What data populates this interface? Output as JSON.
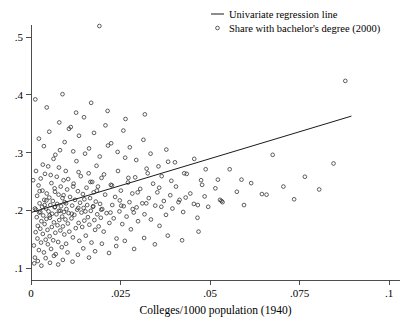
{
  "chart_data": {
    "type": "scatter",
    "title": "",
    "xlabel": "Colleges/1000 population (1940)",
    "ylabel": "",
    "xlim": [
      0,
      0.1
    ],
    "ylim": [
      0.08,
      0.54
    ],
    "grid": false,
    "legend_position": "top-right",
    "xticks": [
      0,
      0.025,
      0.05,
      0.075,
      0.1
    ],
    "xtick_labels": [
      "0",
      ".025",
      ".05",
      ".075",
      ".1"
    ],
    "yticks": [
      0.1,
      0.2,
      0.3,
      0.4,
      0.5
    ],
    "ytick_labels": [
      ".1",
      ".2",
      ".3",
      ".4",
      ".5"
    ],
    "series": [
      {
        "name": "Share with bachelor's degree (2000)",
        "type": "scatter",
        "marker": "open-circle",
        "color": "#2b2b2b",
        "points": [
          [
            0.0008,
            0.139
          ],
          [
            0.0011,
            0.118
          ],
          [
            0.0013,
            0.162
          ],
          [
            0.0014,
            0.201
          ],
          [
            0.0016,
            0.188
          ],
          [
            0.0017,
            0.225
          ],
          [
            0.0018,
            0.151
          ],
          [
            0.0019,
            0.173
          ],
          [
            0.0021,
            0.243
          ],
          [
            0.0022,
            0.131
          ],
          [
            0.0023,
            0.196
          ],
          [
            0.0024,
            0.212
          ],
          [
            0.0026,
            0.168
          ],
          [
            0.0027,
            0.255
          ],
          [
            0.0028,
            0.144
          ],
          [
            0.0029,
            0.181
          ],
          [
            0.0031,
            0.206
          ],
          [
            0.0032,
            0.234
          ],
          [
            0.0033,
            0.159
          ],
          [
            0.0034,
            0.191
          ],
          [
            0.0036,
            0.127
          ],
          [
            0.0037,
            0.218
          ],
          [
            0.0038,
            0.176
          ],
          [
            0.0039,
            0.263
          ],
          [
            0.0041,
            0.149
          ],
          [
            0.0042,
            0.203
          ],
          [
            0.0043,
            0.185
          ],
          [
            0.0044,
            0.229
          ],
          [
            0.0046,
            0.166
          ],
          [
            0.0047,
            0.141
          ],
          [
            0.0048,
            0.276
          ],
          [
            0.0049,
            0.198
          ],
          [
            0.0051,
            0.222
          ],
          [
            0.0052,
            0.155
          ],
          [
            0.0053,
            0.187
          ],
          [
            0.0054,
            0.209
          ],
          [
            0.0056,
            0.133
          ],
          [
            0.0057,
            0.247
          ],
          [
            0.0058,
            0.171
          ],
          [
            0.0059,
            0.194
          ],
          [
            0.0061,
            0.216
          ],
          [
            0.0062,
            0.148
          ],
          [
            0.0063,
            0.289
          ],
          [
            0.0064,
            0.179
          ],
          [
            0.0066,
            0.205
          ],
          [
            0.0067,
            0.232
          ],
          [
            0.0068,
            0.161
          ],
          [
            0.0069,
            0.124
          ],
          [
            0.0071,
            0.193
          ],
          [
            0.0072,
            0.258
          ],
          [
            0.0073,
            0.211
          ],
          [
            0.0074,
            0.174
          ],
          [
            0.0076,
            0.145
          ],
          [
            0.0077,
            0.227
          ],
          [
            0.0078,
            0.199
          ],
          [
            0.0079,
            0.183
          ],
          [
            0.0081,
            0.304
          ],
          [
            0.0082,
            0.165
          ],
          [
            0.0083,
            0.241
          ],
          [
            0.0084,
            0.207
          ],
          [
            0.0086,
            0.136
          ],
          [
            0.0087,
            0.189
          ],
          [
            0.0088,
            0.221
          ],
          [
            0.0089,
            0.172
          ],
          [
            0.0091,
            0.252
          ],
          [
            0.0092,
            0.197
          ],
          [
            0.0093,
            0.158
          ],
          [
            0.0094,
            0.214
          ],
          [
            0.0096,
            0.184
          ],
          [
            0.0097,
            0.268
          ],
          [
            0.0098,
            0.142
          ],
          [
            0.0099,
            0.202
          ],
          [
            0.0101,
            0.236
          ],
          [
            0.0103,
            0.177
          ],
          [
            0.0105,
            0.195
          ],
          [
            0.0107,
            0.163
          ],
          [
            0.0109,
            0.223
          ],
          [
            0.0111,
            0.344
          ],
          [
            0.0113,
            0.186
          ],
          [
            0.0115,
            0.208
          ],
          [
            0.0117,
            0.153
          ],
          [
            0.0119,
            0.246
          ],
          [
            0.0121,
            0.192
          ],
          [
            0.0123,
            0.218
          ],
          [
            0.0125,
            0.169
          ],
          [
            0.0127,
            0.285
          ],
          [
            0.0129,
            0.201
          ],
          [
            0.0131,
            0.233
          ],
          [
            0.0133,
            0.178
          ],
          [
            0.0135,
            0.147
          ],
          [
            0.0137,
            0.213
          ],
          [
            0.0139,
            0.259
          ],
          [
            0.0141,
            0.196
          ],
          [
            0.0143,
            0.171
          ],
          [
            0.0145,
            0.228
          ],
          [
            0.0147,
            0.204
          ],
          [
            0.0149,
            0.182
          ],
          [
            0.0151,
            0.298
          ],
          [
            0.0153,
            0.156
          ],
          [
            0.0155,
            0.239
          ],
          [
            0.0157,
            0.209
          ],
          [
            0.0159,
            0.188
          ],
          [
            0.0161,
            0.264
          ],
          [
            0.0163,
            0.175
          ],
          [
            0.0165,
            0.221
          ],
          [
            0.0167,
            0.199
          ],
          [
            0.0169,
            0.144
          ],
          [
            0.0171,
            0.249
          ],
          [
            0.0173,
            0.206
          ],
          [
            0.0175,
            0.231
          ],
          [
            0.0177,
            0.183
          ],
          [
            0.0179,
            0.166
          ],
          [
            0.0181,
            0.215
          ],
          [
            0.0183,
            0.277
          ],
          [
            0.0185,
            0.193
          ],
          [
            0.0187,
            0.241
          ],
          [
            0.0189,
            0.172
          ],
          [
            0.0191,
            0.519
          ],
          [
            0.0193,
            0.211
          ],
          [
            0.0195,
            0.187
          ],
          [
            0.0197,
            0.256
          ],
          [
            0.0199,
            0.202
          ],
          [
            0.0203,
            0.163
          ],
          [
            0.0207,
            0.227
          ],
          [
            0.0211,
            0.195
          ],
          [
            0.0215,
            0.312
          ],
          [
            0.0219,
            0.178
          ],
          [
            0.0223,
            0.244
          ],
          [
            0.0227,
            0.209
          ],
          [
            0.0231,
            0.186
          ],
          [
            0.0235,
            0.223
          ],
          [
            0.0239,
            0.151
          ],
          [
            0.0243,
            0.268
          ],
          [
            0.0247,
            0.198
          ],
          [
            0.0251,
            0.234
          ],
          [
            0.0255,
            0.176
          ],
          [
            0.0259,
            0.207
          ],
          [
            0.0263,
            0.291
          ],
          [
            0.0267,
            0.189
          ],
          [
            0.0271,
            0.248
          ],
          [
            0.0275,
            0.214
          ],
          [
            0.0279,
            0.167
          ],
          [
            0.0283,
            0.229
          ],
          [
            0.0287,
            0.196
          ],
          [
            0.0291,
            0.257
          ],
          [
            0.0295,
            0.205
          ],
          [
            0.0299,
            0.181
          ],
          [
            0.0305,
            0.237
          ],
          [
            0.0311,
            0.212
          ],
          [
            0.0317,
            0.193
          ],
          [
            0.0323,
            0.272
          ],
          [
            0.0329,
            0.221
          ],
          [
            0.0335,
            0.184
          ],
          [
            0.0341,
            0.246
          ],
          [
            0.0347,
            0.208
          ],
          [
            0.0353,
            0.231
          ],
          [
            0.0359,
            0.173
          ],
          [
            0.0365,
            0.259
          ],
          [
            0.0371,
            0.216
          ],
          [
            0.0377,
            0.192
          ],
          [
            0.0383,
            0.284
          ],
          [
            0.0389,
            0.226
          ],
          [
            0.0395,
            0.203
          ],
          [
            0.0405,
            0.241
          ],
          [
            0.0415,
            0.218
          ],
          [
            0.0425,
            0.197
          ],
          [
            0.0435,
            0.263
          ],
          [
            0.0445,
            0.229
          ],
          [
            0.0455,
            0.211
          ],
          [
            0.0465,
            0.187
          ],
          [
            0.0475,
            0.252
          ],
          [
            0.0485,
            0.224
          ],
          [
            0.0495,
            0.206
          ],
          [
            0.0515,
            0.238
          ],
          [
            0.0535,
            0.214
          ],
          [
            0.0555,
            0.271
          ],
          [
            0.0575,
            0.232
          ],
          [
            0.0595,
            0.209
          ],
          [
            0.0615,
            0.247
          ],
          [
            0.0645,
            0.228
          ],
          [
            0.0675,
            0.296
          ],
          [
            0.0705,
            0.241
          ],
          [
            0.0735,
            0.219
          ],
          [
            0.0765,
            0.258
          ],
          [
            0.0805,
            0.236
          ],
          [
            0.0845,
            0.281
          ],
          [
            0.0878,
            0.424
          ],
          [
            0.0022,
            0.324
          ],
          [
            0.0036,
            0.311
          ],
          [
            0.0051,
            0.336
          ],
          [
            0.0068,
            0.296
          ],
          [
            0.0079,
            0.352
          ],
          [
            0.0094,
            0.318
          ],
          [
            0.0106,
            0.341
          ],
          [
            0.0118,
            0.302
          ],
          [
            0.0134,
            0.329
          ],
          [
            0.0148,
            0.361
          ],
          [
            0.0162,
            0.307
          ],
          [
            0.0176,
            0.334
          ],
          [
            0.0192,
            0.293
          ],
          [
            0.0208,
            0.347
          ],
          [
            0.0224,
            0.316
          ],
          [
            0.0242,
            0.301
          ],
          [
            0.0258,
            0.338
          ],
          [
            0.0276,
            0.309
          ],
          [
            0.0294,
            0.287
          ],
          [
            0.0314,
            0.322
          ],
          [
            0.0334,
            0.298
          ],
          [
            0.0356,
            0.276
          ],
          [
            0.0378,
            0.305
          ],
          [
            0.0402,
            0.283
          ],
          [
            0.0428,
            0.264
          ],
          [
            0.0456,
            0.289
          ],
          [
            0.0488,
            0.271
          ],
          [
            0.0522,
            0.253
          ],
          [
            0.0012,
            0.392
          ],
          [
            0.0044,
            0.378
          ],
          [
            0.0088,
            0.401
          ],
          [
            0.0126,
            0.369
          ],
          [
            0.0168,
            0.386
          ],
          [
            0.0214,
            0.372
          ],
          [
            0.0264,
            0.358
          ],
          [
            0.0318,
            0.366
          ],
          [
            0.0009,
            0.108
          ],
          [
            0.0019,
            0.112
          ],
          [
            0.0029,
            0.104
          ],
          [
            0.0041,
            0.117
          ],
          [
            0.0053,
            0.109
          ],
          [
            0.0064,
            0.121
          ],
          [
            0.0076,
            0.106
          ],
          [
            0.0089,
            0.114
          ],
          [
            0.0102,
            0.127
          ],
          [
            0.0116,
            0.111
          ],
          [
            0.0131,
            0.123
          ],
          [
            0.0146,
            0.134
          ],
          [
            0.0162,
            0.118
          ],
          [
            0.0179,
            0.129
          ],
          [
            0.0198,
            0.142
          ],
          [
            0.0218,
            0.126
          ],
          [
            0.0238,
            0.138
          ],
          [
            0.0262,
            0.147
          ],
          [
            0.0288,
            0.133
          ],
          [
            0.0316,
            0.152
          ],
          [
            0.0346,
            0.141
          ],
          [
            0.0382,
            0.156
          ],
          [
            0.0422,
            0.148
          ],
          [
            0.0468,
            0.163
          ],
          [
            0.0006,
            0.252
          ],
          [
            0.0014,
            0.268
          ],
          [
            0.0024,
            0.233
          ],
          [
            0.0033,
            0.279
          ],
          [
            0.0043,
            0.217
          ],
          [
            0.0055,
            0.261
          ],
          [
            0.0066,
            0.238
          ],
          [
            0.0078,
            0.274
          ],
          [
            0.0091,
            0.226
          ],
          [
            0.0104,
            0.254
          ],
          [
            0.0118,
            0.241
          ],
          [
            0.0133,
            0.266
          ],
          [
            0.0149,
            0.219
          ],
          [
            0.0166,
            0.249
          ],
          [
            0.0184,
            0.234
          ],
          [
            0.0204,
            0.262
          ],
          [
            0.0226,
            0.243
          ],
          [
            0.0248,
            0.217
          ],
          [
            0.0272,
            0.256
          ],
          [
            0.0298,
            0.231
          ],
          [
            0.0326,
            0.264
          ],
          [
            0.0358,
            0.239
          ],
          [
            0.0392,
            0.251
          ],
          [
            0.0432,
            0.222
          ],
          [
            0.0478,
            0.244
          ],
          [
            0.0528,
            0.218
          ],
          [
            0.0588,
            0.253
          ],
          [
            0.0658,
            0.227
          ],
          [
            0.0011,
            0.203
          ],
          [
            0.0026,
            0.197
          ],
          [
            0.0038,
            0.209
          ],
          [
            0.0052,
            0.191
          ],
          [
            0.0067,
            0.206
          ],
          [
            0.0082,
            0.199
          ],
          [
            0.0098,
            0.212
          ],
          [
            0.0114,
            0.194
          ],
          [
            0.0132,
            0.204
          ],
          [
            0.0152,
            0.198
          ],
          [
            0.0174,
            0.207
          ],
          [
            0.0196,
            0.201
          ],
          [
            0.0222,
            0.196
          ],
          [
            0.0252,
            0.208
          ],
          [
            0.0284,
            0.202
          ],
          [
            0.0322,
            0.212
          ],
          [
            0.0364,
            0.206
          ],
          [
            0.0412,
            0.214
          ],
          [
            0.0466,
            0.209
          ],
          [
            0.0532,
            0.216
          ]
        ]
      }
    ],
    "regression_line": {
      "name": "Univariate regression line",
      "color": "#1a1a1a",
      "x_start": 0.0,
      "y_start": 0.196,
      "x_end": 0.0895,
      "y_end": 0.363
    },
    "legend_entries": [
      {
        "label": "Univariate regression line",
        "marker": "line"
      },
      {
        "label": "Share with bachelor's degree (2000)",
        "marker": "open-circle"
      }
    ]
  }
}
